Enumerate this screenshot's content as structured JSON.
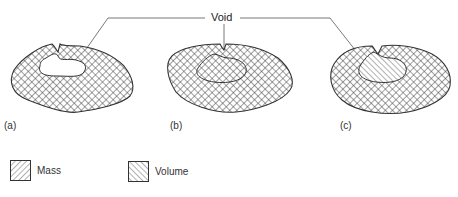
{
  "diagram": {
    "callout": {
      "label": "Void"
    },
    "panels": [
      {
        "id": "a",
        "label": "(a)",
        "void_fill": "empty",
        "description": "Void open region within mass"
      },
      {
        "id": "b",
        "label": "(b)",
        "void_fill": "outline",
        "description": "Void enclosed, outlined only"
      },
      {
        "id": "c",
        "label": "(c)",
        "void_fill": "volume-hatch",
        "description": "Void filled with volume hatching"
      }
    ],
    "legend": [
      {
        "name": "mass",
        "label": "Mass",
        "pattern": "diagonal-forward"
      },
      {
        "name": "volume",
        "label": "Volume",
        "pattern": "diagonal-backward"
      }
    ],
    "colors": {
      "ink": "#333333",
      "background": "#ffffff"
    }
  }
}
